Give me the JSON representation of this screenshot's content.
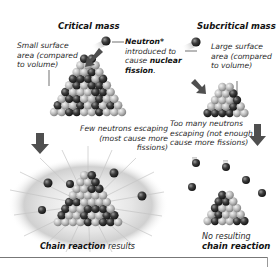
{
  "critical": {
    "title": "Critical mass",
    "surface_note": [
      "Small surface",
      "area (compared",
      "to volume)"
    ],
    "escape_note": [
      "Few neutrons escaping",
      "(most cause more",
      "fissions)"
    ],
    "result_bold": "Chain reaction",
    "result_rest": " results"
  },
  "neutron": {
    "label_bold": "Neutron*",
    "line2": "introduced to",
    "line3_pre": "cause ",
    "line3_bold": "nuclear",
    "line4_bold": "fission",
    "line4_rest": "."
  },
  "subcritical": {
    "title": "Subcritical mass",
    "surface_note": [
      "Large surface",
      "area (compared",
      "to volume)"
    ],
    "escape_note": [
      "Too many neutrons",
      "escaping (not enough",
      "cause more fissions)"
    ],
    "result_line1": "No resulting",
    "result_bold": "chain reaction"
  },
  "colors": {
    "sphere_light": "#c9c9c9",
    "sphere_dark": "#3a3a3a",
    "arrow": "#555555",
    "burst": "#d8d8d8"
  }
}
